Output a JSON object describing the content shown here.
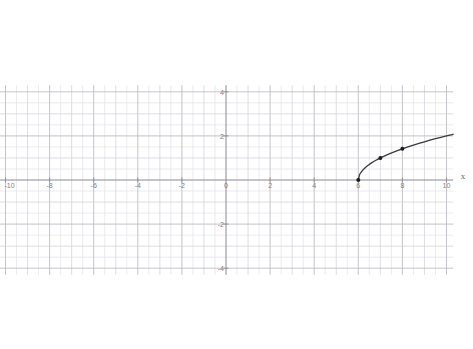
{
  "chart_data": {
    "type": "line",
    "title": "",
    "subtitle": "",
    "xlabel": "x",
    "ylabel": "",
    "function_label": "y = sqrt(x - 6)",
    "xlim": [
      -10.3,
      10.3
    ],
    "ylim": [
      -4.3,
      4.3
    ],
    "grid": true,
    "minor_grid": true,
    "grid_step": 1,
    "minor_grid_step": 0.5,
    "major_tick_step": 2,
    "legend": "none",
    "x_tick_labels": [
      "-10",
      "-8",
      "-6",
      "-4",
      "-2",
      "0",
      "2",
      "4",
      "6",
      "8",
      "10"
    ],
    "x_tick_values": [
      -10,
      -8,
      -6,
      -4,
      -2,
      0,
      2,
      4,
      6,
      8,
      10
    ],
    "y_tick_labels": [
      "4",
      "2",
      "0",
      "-2",
      "-4"
    ],
    "y_tick_values": [
      4,
      2,
      0,
      -2,
      -4
    ],
    "series": [
      {
        "name": "y = sqrt(x - 6)",
        "color": "#3a3a3e",
        "domain_start": 6,
        "domain_end": 10.3,
        "x": [
          6,
          6.05,
          6.1,
          6.2,
          6.3,
          6.4,
          6.5,
          6.6,
          6.7,
          6.8,
          6.9,
          7,
          7.2,
          7.4,
          7.6,
          7.8,
          8,
          8.25,
          8.5,
          8.75,
          9,
          9.25,
          9.5,
          9.75,
          10,
          10.3
        ],
        "values": [
          0,
          0.224,
          0.316,
          0.447,
          0.548,
          0.632,
          0.707,
          0.775,
          0.837,
          0.894,
          0.949,
          1,
          1.095,
          1.183,
          1.265,
          1.342,
          1.414,
          1.5,
          1.581,
          1.658,
          1.732,
          1.803,
          1.871,
          1.936,
          2,
          2.074
        ]
      }
    ],
    "marked_points": [
      {
        "label": "(6, 0)",
        "x": 6,
        "y": 0
      },
      {
        "label": "(7, 1)",
        "x": 7,
        "y": 1
      },
      {
        "label": "(8, 1.41)",
        "x": 8,
        "y": 1.414
      }
    ],
    "colors": {
      "curve": "#3a3a3e",
      "axis": "#8a8a92",
      "major_grid": "#b9b9c2",
      "minor_grid": "#e2e2e8",
      "point": "#1c1c1e",
      "background": "#ffffff",
      "tick_text": "#6a6a72"
    }
  }
}
